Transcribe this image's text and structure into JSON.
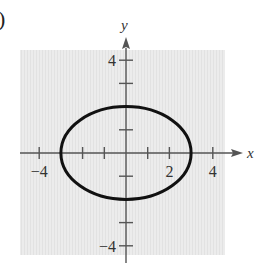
{
  "panel": {
    "label": ")"
  },
  "colors": {
    "background": "#ffffff",
    "grid_fill": "#ececec",
    "grid_stripe": "#e2e2e2",
    "axis": "#555555",
    "curve": "#111111",
    "text": "#333333"
  },
  "chart_data": {
    "type": "line",
    "title": "",
    "xlabel": "x",
    "ylabel": "y",
    "xlim": [
      -4.5,
      4.5
    ],
    "ylim": [
      -4.5,
      4.5
    ],
    "grid": true,
    "x_ticks": [
      -4,
      -3,
      -2,
      -1,
      1,
      2,
      3,
      4
    ],
    "y_ticks": [
      -4,
      -3,
      -2,
      -1,
      1,
      2,
      3,
      4
    ],
    "x_tick_labels": [
      {
        "value": -4,
        "label": "−4"
      },
      {
        "value": 2,
        "label": "2"
      },
      {
        "value": 4,
        "label": "4"
      }
    ],
    "y_tick_labels": [
      {
        "value": 4,
        "label": "4"
      },
      {
        "value": -4,
        "label": "−4"
      }
    ],
    "series": [
      {
        "name": "ellipse",
        "shape": "ellipse",
        "equation": "x^2/9 + y^2/4 = 1",
        "center": [
          0,
          0
        ],
        "semi_axis_x": 3,
        "semi_axis_y": 2
      }
    ],
    "legend": null
  }
}
